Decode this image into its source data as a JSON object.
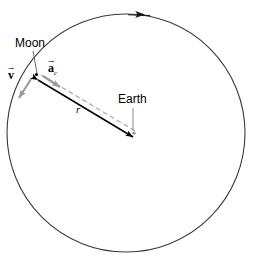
{
  "figure": {
    "type": "physics-diagram",
    "background_color": "#ffffff",
    "width": 256,
    "height": 265
  },
  "orbit": {
    "name": "moon-orbit-circle",
    "center_x": 126,
    "center_y": 133,
    "radius": 119,
    "stroke_color": "#3a3a3a",
    "stroke_width": 1,
    "direction_marker": {
      "name": "orbit-direction-arrow",
      "position_x": 136,
      "position_y": 14,
      "points": "left",
      "meaning": "counterclockwise orbital travel"
    }
  },
  "bodies": {
    "moon": {
      "label": "Moon",
      "x": 36,
      "y": 74,
      "leader_from_x": 32,
      "leader_from_y": 50,
      "color": "#000000"
    },
    "earth": {
      "label": "Earth",
      "x": 133,
      "y": 133,
      "leader_from_x": 133,
      "leader_from_y": 108,
      "color": "#000000"
    }
  },
  "vectors": {
    "radius": {
      "label": "r",
      "name": "radius-vector",
      "style": "solid double-headed arrow",
      "color": "#000000",
      "from_x": 38,
      "from_y": 79,
      "to_x": 133,
      "to_y": 136,
      "label_x": 76,
      "label_y": 104
    },
    "velocity": {
      "label": "v",
      "symbol": "v",
      "accent": "arrow",
      "name": "velocity-vector",
      "color": "#9a9a9a",
      "style": "tangential gray arrow",
      "from_x": 31,
      "from_y": 80,
      "to_x": 19,
      "to_y": 99,
      "label_x": 8,
      "label_y": 69
    },
    "centripetal_acceleration": {
      "label": "a",
      "symbol": "a",
      "subscript": "c",
      "accent": "arrow",
      "name": "centripetal-acceleration-vector",
      "color": "#9a9a9a",
      "style": "gray dashed line toward Earth with solid gray arrowhead",
      "from_x": 40,
      "from_y": 76,
      "to_x": 137,
      "to_y": 133,
      "arrowhead_x": 59,
      "arrowhead_y": 87,
      "label_x": 48,
      "label_y": 62
    }
  },
  "colors": {
    "stroke": "#3a3a3a",
    "black": "#000000",
    "gray": "#9a9a9a",
    "dashed_gray": "#a8a8a8",
    "background": "#ffffff"
  }
}
